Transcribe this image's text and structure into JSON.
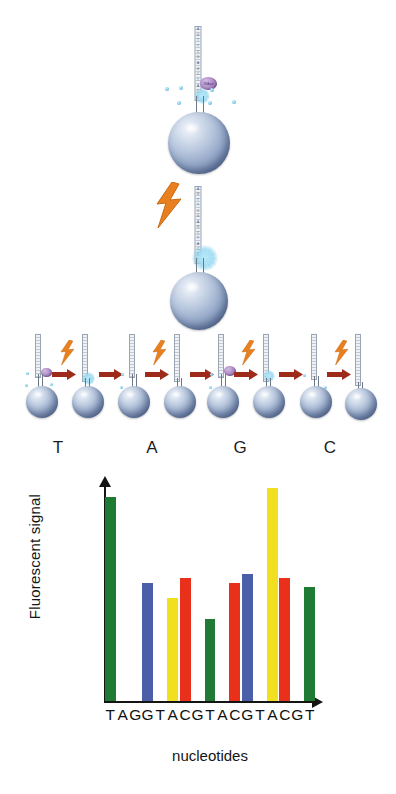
{
  "figure": {
    "stages": {
      "incorporation_label": "DNA polymerase incorporating a labelled nucleotide on a bead-bound template",
      "emission_label": "Light flash released on incorporation, detected as fluorescent signal"
    }
  },
  "template_strand": {
    "top_sequence": [
      "A",
      "G",
      "T",
      "T",
      "C",
      "G",
      "A",
      "G",
      "C",
      "T",
      "A",
      "C",
      "A"
    ],
    "mid_sequence": [
      "A",
      "G",
      "T",
      "T",
      "C",
      "G",
      "A",
      "G",
      "C",
      "T",
      "A",
      "C",
      "A",
      "T"
    ],
    "polymerase_tag": "DNA pol"
  },
  "cycle_row": {
    "labels": [
      "T",
      "A",
      "G",
      "C"
    ],
    "label_positions": [
      58,
      152,
      240,
      330
    ],
    "pair_sequences": [
      {
        "label": "T",
        "before": [
          "A",
          "G",
          "T",
          "T",
          "C",
          "G",
          "A",
          "C"
        ],
        "after": [
          "A",
          "G",
          "T",
          "T",
          "C",
          "G",
          "A",
          "C",
          "T"
        ]
      },
      {
        "label": "A",
        "before": [
          "A",
          "G",
          "T",
          "T",
          "C",
          "G",
          "A",
          "C"
        ],
        "after": [
          "A",
          "G",
          "T",
          "T",
          "C",
          "G",
          "A",
          "C",
          "A"
        ]
      },
      {
        "label": "G",
        "before": [
          "A",
          "G",
          "T",
          "T",
          "C",
          "G",
          "A",
          "C"
        ],
        "after": [
          "A",
          "G",
          "T",
          "T",
          "C",
          "G",
          "A",
          "C",
          "G"
        ]
      },
      {
        "label": "C",
        "before": [
          "A",
          "G",
          "T",
          "T",
          "C",
          "G",
          "A",
          "C"
        ],
        "after": [
          "A",
          "G",
          "T",
          "T",
          "C",
          "G",
          "A",
          "C",
          "C"
        ]
      }
    ],
    "arrow_name": "process-arrow",
    "bolt_name": "light-flash-bolt"
  },
  "colors": {
    "bead": "#8fa3c4",
    "bead_dark": "#55678c",
    "bolt": "#e8801f",
    "arrow": "#9e2b1a",
    "polymerase": "#b392c9",
    "fluorescence": "#7fd0ef",
    "axis": "#141414",
    "bar_A": "#1f7a33",
    "bar_C": "#f0e020",
    "bar_G": "#e8301a",
    "bar_T": "#4a5fa8"
  },
  "chart_data": {
    "type": "bar",
    "title": "",
    "xlabel": "nucleotides",
    "ylabel": "Fluorescent signal",
    "categories": [
      "T",
      "A",
      "G",
      "G",
      "T",
      "A",
      "C",
      "G",
      "T",
      "A",
      "C",
      "G",
      "T",
      "A",
      "C",
      "G",
      "T"
    ],
    "tick_labels": [
      "T",
      "A",
      "G",
      "G",
      "T",
      "A",
      "C",
      "G",
      "T",
      "A",
      "C",
      "G",
      "T",
      "A",
      "C",
      "G",
      "T"
    ],
    "values": [
      95,
      0,
      0,
      55,
      0,
      48,
      57,
      0,
      38,
      0,
      55,
      59,
      0,
      99,
      57,
      0,
      53
    ],
    "bar_colors": [
      "#1f7a33",
      null,
      null,
      "#4a5fa8",
      null,
      "#f0e020",
      "#e8301a",
      null,
      "#1f7a33",
      null,
      "#e8301a",
      "#4a5fa8",
      null,
      "#f0e020",
      "#e8301a",
      null,
      "#1f7a33"
    ],
    "ylim": [
      0,
      100
    ],
    "grid": false,
    "legend": false,
    "note": "Signal height per flow; empty positions show no incorporation"
  }
}
